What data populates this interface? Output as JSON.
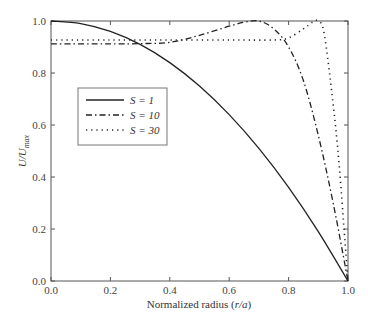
{
  "chart_data": {
    "type": "line",
    "title": "",
    "xlabel": "Normalized radius (r/a)",
    "ylabel": "U/U_max",
    "xlim": [
      0.0,
      1.0
    ],
    "ylim": [
      0.0,
      1.0
    ],
    "xticks": [
      "0.0",
      "0.2",
      "0.4",
      "0.6",
      "0.8",
      "1.0"
    ],
    "yticks": [
      "0.0",
      "0.2",
      "0.4",
      "0.6",
      "0.8",
      "1.0"
    ],
    "grid": false,
    "legend_position": "upper-left-inside",
    "series": [
      {
        "name": "S = 1",
        "style": "solid",
        "x": [
          0.0,
          0.1,
          0.2,
          0.3,
          0.4,
          0.5,
          0.6,
          0.7,
          0.8,
          0.9,
          1.0
        ],
        "y": [
          1.0,
          0.99,
          0.96,
          0.91,
          0.84,
          0.75,
          0.64,
          0.51,
          0.36,
          0.19,
          0.0
        ]
      },
      {
        "name": "S = 10",
        "style": "dash-dot",
        "x": [
          0.0,
          0.2,
          0.3,
          0.4,
          0.5,
          0.6,
          0.65,
          0.7,
          0.75,
          0.8,
          0.85,
          0.9,
          0.95,
          1.0
        ],
        "y": [
          0.912,
          0.912,
          0.913,
          0.918,
          0.945,
          0.98,
          0.995,
          1.0,
          0.97,
          0.9,
          0.77,
          0.56,
          0.3,
          0.0
        ]
      },
      {
        "name": "S = 30",
        "style": "dotted",
        "x": [
          0.0,
          0.2,
          0.4,
          0.6,
          0.75,
          0.8,
          0.85,
          0.88,
          0.9,
          0.92,
          0.95,
          0.97,
          0.99,
          1.0
        ],
        "y": [
          0.927,
          0.927,
          0.927,
          0.927,
          0.927,
          0.935,
          0.97,
          0.995,
          1.0,
          0.95,
          0.68,
          0.45,
          0.15,
          0.0
        ]
      }
    ]
  },
  "labels": {
    "xlabel_main": "Normalized radius (",
    "xlabel_var": "r/a",
    "xlabel_end": ")",
    "ylabel_main": "U/U",
    "ylabel_sub": "max",
    "legend": [
      "S = 1",
      "S = 10",
      "S = 30"
    ]
  }
}
